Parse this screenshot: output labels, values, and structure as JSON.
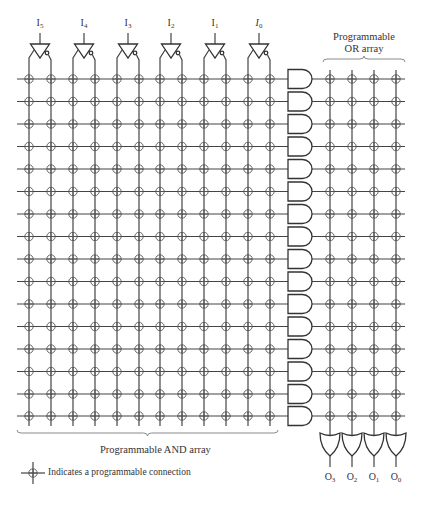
{
  "diagram": {
    "inputs": [
      {
        "name": "I",
        "sub": "5",
        "x": 40
      },
      {
        "name": "I",
        "sub": "4",
        "x": 84
      },
      {
        "name": "I",
        "sub": "3",
        "x": 128
      },
      {
        "name": "I",
        "sub": "2",
        "x": 171
      },
      {
        "name": "I",
        "sub": "1",
        "x": 215
      },
      {
        "name": "I",
        "sub": "0",
        "x": 259,
        "italic": true
      }
    ],
    "and_array": {
      "label": "Programmable AND array",
      "columns_x": [
        29,
        51,
        73,
        95,
        117,
        139,
        160,
        182,
        204,
        226,
        248,
        270
      ],
      "rows_y": [
        79,
        101.5,
        124,
        146.5,
        169,
        191.5,
        214,
        236.5,
        259,
        281.5,
        304,
        326.5,
        349,
        371.5,
        394,
        416
      ],
      "row_line_start_x": 17,
      "gate_left_x": 288,
      "gate_width": 24,
      "gate_height": 19,
      "gate_count": 16
    },
    "or_array": {
      "label_line1": "Programmable",
      "label_line2": "OR array",
      "columns_x": [
        330,
        352,
        374,
        396
      ],
      "top_y": 70,
      "gate_top_y": 433,
      "gate_bottom_y": 456
    },
    "outputs": [
      {
        "name": "O",
        "sub": "3",
        "x": 330
      },
      {
        "name": "O",
        "sub": "2",
        "x": 352
      },
      {
        "name": "O",
        "sub": "1",
        "x": 374
      },
      {
        "name": "O",
        "sub": "0",
        "x": 396
      }
    ],
    "legend": {
      "text": "Indicates a programmable connection"
    },
    "colors": {
      "line": "#444444",
      "bracket": "#8a8a8a",
      "text": "#333333",
      "background": "#ffffff"
    }
  }
}
